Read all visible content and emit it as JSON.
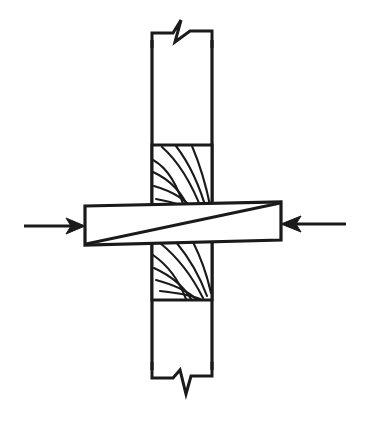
{
  "figure": {
    "background_color": "#ffffff",
    "line_color": "#1a1a1a",
    "width": 367,
    "height": 423
  },
  "vertical_member": {
    "name": "vertical-post",
    "left": 152,
    "right": 212,
    "top": 32,
    "bottom": 378,
    "fill": "#ffffff"
  },
  "grain_blocks": [
    {
      "name": "upper-end-grain-block",
      "left": 152,
      "right": 212,
      "top": 145,
      "bottom": 213,
      "arc_count": 7,
      "orientation": "center-bottom-right"
    },
    {
      "name": "lower-end-grain-block",
      "left": 152,
      "right": 212,
      "top": 241,
      "bottom": 300,
      "arc_count": 7,
      "orientation": "center-bottom-right"
    }
  ],
  "horizontal_member": {
    "name": "horizontal-beam",
    "left": 85,
    "right": 281,
    "left_top": 206,
    "left_bottom": 245,
    "right_top": 202,
    "right_bottom": 240,
    "fill": "#ffffff",
    "diagonal": {
      "name": "beam-diagonal-split-line",
      "from_x": 86,
      "from_y": 244,
      "to_x": 280,
      "to_y": 203
    }
  },
  "break_symbols": [
    {
      "name": "top-break-symbol",
      "position": "top",
      "y": 32,
      "x_center": 182,
      "meaning": "member continues beyond"
    },
    {
      "name": "bottom-break-symbol",
      "position": "bottom",
      "y": 378,
      "x_center": 182,
      "meaning": "member continues beyond"
    }
  ],
  "load_arrows": [
    {
      "name": "left-compression-arrow",
      "direction": "right",
      "shaft_from_x": 24,
      "shaft_to_x": 84,
      "y": 226,
      "label": ""
    },
    {
      "name": "right-compression-arrow",
      "direction": "left",
      "shaft_from_x": 346,
      "shaft_to_x": 282,
      "y": 224,
      "label": ""
    }
  ]
}
